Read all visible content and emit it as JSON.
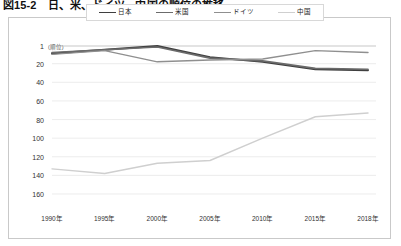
{
  "figure": {
    "caption": "図15-2　日、米、ドイツ、中国の順位の推移"
  },
  "legend": {
    "position": "top-center",
    "items": [
      {
        "label": "日本",
        "color": "#3f3f3f",
        "width": 1.9
      },
      {
        "label": "米国",
        "color": "#6b6b6b",
        "width": 1.6
      },
      {
        "label": "ドイツ",
        "color": "#8f8f8f",
        "width": 1.4
      },
      {
        "label": "中国",
        "color": "#cfcfcf",
        "width": 1.4
      }
    ]
  },
  "axes": {
    "y_unit_label": "(順位)",
    "y_ticks": [
      "1",
      "20",
      "40",
      "60",
      "80",
      "100",
      "120",
      "140",
      "160"
    ],
    "x_ticks": [
      "1990年",
      "1995年",
      "2000年",
      "2005年",
      "2010年",
      "2015年",
      "2018年"
    ]
  },
  "chart_data": {
    "type": "line",
    "title": "図15-2　日、米、ドイツ、中国の順位の推移",
    "xlabel": "",
    "ylabel": "(順位)",
    "categories": [
      "1990年",
      "1995年",
      "2000年",
      "2005年",
      "2010年",
      "2015年",
      "2018年"
    ],
    "x": [
      1990,
      1995,
      2000,
      2005,
      2010,
      2015,
      2018
    ],
    "ylim": [
      1,
      160
    ],
    "y_inverted": true,
    "y_ticks": [
      1,
      20,
      40,
      60,
      80,
      100,
      120,
      140,
      160
    ],
    "grid": true,
    "legend_position": "top-center",
    "series": [
      {
        "name": "日本",
        "color": "#3f3f3f",
        "values": [
          9,
          5,
          1,
          13,
          18,
          26,
          27
        ]
      },
      {
        "name": "米国",
        "color": "#6b6b6b",
        "values": [
          8,
          5,
          2,
          14,
          17,
          25,
          26
        ]
      },
      {
        "name": "ドイツ",
        "color": "#8f8f8f",
        "values": [
          10,
          6,
          18,
          16,
          15,
          6,
          8
        ]
      },
      {
        "name": "中国",
        "color": "#cfcfcf",
        "values": [
          133,
          138,
          127,
          124,
          100,
          77,
          73
        ]
      }
    ]
  }
}
